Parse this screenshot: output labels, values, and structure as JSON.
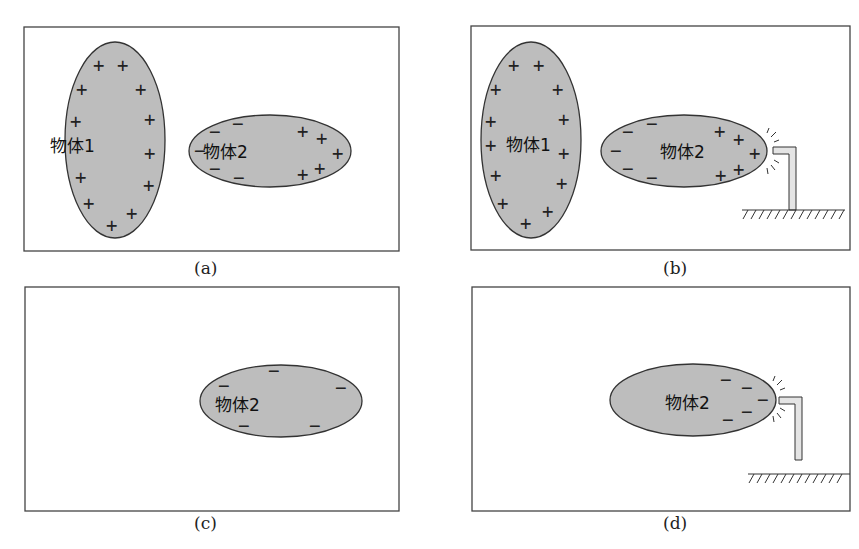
{
  "panels": [
    {
      "id": "a",
      "caption": "(a)",
      "object1_label": "物体1",
      "object2_label": "物体2",
      "grounded": false
    },
    {
      "id": "b",
      "caption": "(b)",
      "object1_label": "物体1",
      "object2_label": "物体2",
      "grounded": true,
      "ground_contact": true
    },
    {
      "id": "c",
      "caption": "(c)",
      "object2_label": "物体2",
      "grounded": false
    },
    {
      "id": "d",
      "caption": "(d)",
      "object2_label": "物体2",
      "grounded": true,
      "ground_contact": true
    }
  ],
  "colors": {
    "fill": "#bdbdbd",
    "stroke": "#333333",
    "frame": "#444444",
    "rod": "#e4e4e4"
  }
}
